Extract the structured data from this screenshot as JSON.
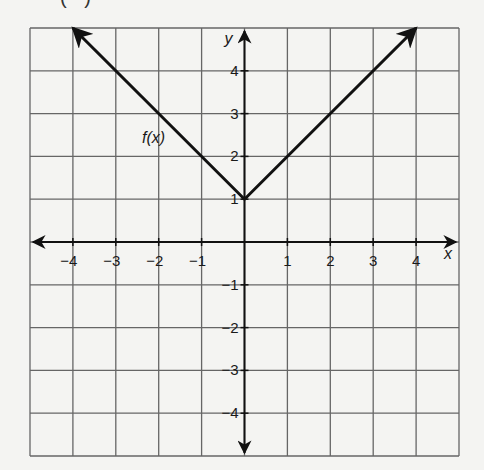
{
  "header": {
    "clipped_label": "( )"
  },
  "chart_data": {
    "type": "line",
    "title": "",
    "xlabel": "x",
    "ylabel": "y",
    "function_label": "f(x)",
    "xlim": [
      -5,
      5
    ],
    "ylim": [
      -5,
      5
    ],
    "grid": true,
    "x_ticks": [
      -4,
      -3,
      -2,
      -1,
      1,
      2,
      3,
      4
    ],
    "y_ticks": [
      4,
      3,
      2,
      1,
      -1,
      -2,
      -3,
      -4
    ],
    "x_tick_labels": [
      "−4",
      "−3",
      "−2",
      "−1",
      "1",
      "2",
      "3",
      "4"
    ],
    "y_tick_labels": [
      "4",
      "3",
      "2",
      "1",
      "−1",
      "−2",
      "−3",
      "−4"
    ],
    "series": [
      {
        "name": "f(x)",
        "x": [
          -4,
          0,
          4
        ],
        "y": [
          5,
          1,
          5
        ],
        "arrows": "both-ends"
      }
    ],
    "annotations": [
      {
        "text": "f(x)",
        "x": -2.3,
        "y": 2.4
      }
    ],
    "colors": {
      "line": "#111111",
      "grid": "#666666",
      "axis": "#111111",
      "background": "#f4f4f2"
    }
  }
}
